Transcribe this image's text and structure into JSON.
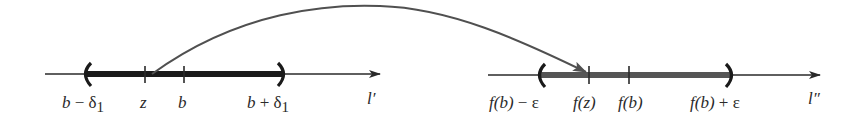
{
  "diagram": {
    "type": "continuity-mapping",
    "colors": {
      "line": "#2a2a2a",
      "domain_interval": "#1a1a1a",
      "range_interval": "#555555",
      "arc": "#505050",
      "background": "#ffffff"
    },
    "domain_line": {
      "name": "l'",
      "label": "l′",
      "interval_open_left": "(",
      "interval_open_right": ")",
      "labels": {
        "left_endpoint_base": "b",
        "left_endpoint_op": " − ",
        "left_endpoint_delta": "δ",
        "left_endpoint_sub": "1",
        "z": "z",
        "b": "b",
        "right_endpoint_base": "b",
        "right_endpoint_op": " + ",
        "right_endpoint_delta": "δ",
        "right_endpoint_sub": "1"
      }
    },
    "range_line": {
      "name": "l''",
      "label": "l″",
      "interval_open_left": "(",
      "interval_open_right": ")",
      "labels": {
        "left_endpoint_f": "f",
        "left_endpoint_arg": "(b)",
        "left_endpoint_rest": " − ε",
        "fz_f": "f",
        "fz_arg": "(z)",
        "fb_f": "f",
        "fb_arg": "(b)",
        "right_endpoint_f": "f",
        "right_endpoint_arg": "(b)",
        "right_endpoint_rest": " + ε"
      }
    },
    "mapping_arrow": {
      "from": "z",
      "to": "f(z)"
    }
  }
}
